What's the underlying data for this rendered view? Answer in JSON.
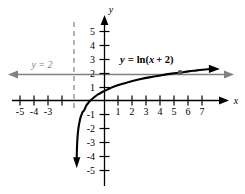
{
  "chart_data": {
    "type": "line",
    "title": "",
    "xlabel": "x",
    "ylabel": "y",
    "xlim": [
      -5.8,
      7.8
    ],
    "ylim": [
      -5.6,
      5.9
    ],
    "grid": false,
    "legend_position": "none",
    "function_label": "y = ln(x + 2)",
    "function_label_parts": {
      "lhs_var": "y",
      "equals": " = ",
      "fn": "ln(",
      "arg_var": "x",
      "arg_rest": " + 2)"
    },
    "asymptote_vertical": {
      "label": "x = -2",
      "x": -2,
      "style": "dashed",
      "color": "#999999"
    },
    "asymptote_horizontal_line": {
      "label": "y = 2",
      "y": 2,
      "style": "solid-arrow-left-right",
      "color": "#808080"
    },
    "marked_point": {
      "x": 5.4,
      "y": 2,
      "style": "filled-dot"
    },
    "x_tick_labels": [
      "-5",
      "-4",
      "-3",
      "1",
      "2",
      "3",
      "4",
      "5",
      "6",
      "7"
    ],
    "x_tick_values": [
      -5,
      -4,
      -3,
      1,
      2,
      3,
      4,
      5,
      6,
      7
    ],
    "y_tick_labels": [
      "5",
      "4",
      "3",
      "2",
      "1",
      "-1",
      "-2",
      "-3",
      "-4",
      "-5"
    ],
    "y_tick_values": [
      5,
      4,
      3,
      2,
      1,
      -1,
      -2,
      -3,
      -4,
      -5
    ],
    "series": [
      {
        "name": "y = ln(x + 2)",
        "color": "#000000",
        "x": [
          -1.985,
          -1.97,
          -1.95,
          -1.92,
          -1.88,
          -1.83,
          -1.78,
          -1.72,
          -1.65,
          -1.55,
          -1.45,
          -1.3,
          -1.15,
          -1.0,
          -0.8,
          -0.6,
          -0.4,
          -0.2,
          0.0,
          0.3,
          0.6,
          1.0,
          1.5,
          2.0,
          2.6,
          3.2,
          4.0,
          4.8,
          5.4,
          6.0,
          6.6,
          7.2,
          7.6
        ],
        "y": [
          -4.2,
          -3.51,
          -3.0,
          -2.53,
          -2.12,
          -1.77,
          -1.51,
          -1.24,
          -1.05,
          -0.8,
          -0.69,
          -0.36,
          -0.16,
          0.0,
          0.18,
          0.34,
          0.47,
          0.59,
          0.69,
          0.83,
          0.96,
          1.1,
          1.25,
          1.39,
          1.53,
          1.65,
          1.79,
          1.92,
          1.99,
          2.08,
          2.15,
          2.22,
          2.26
        ]
      }
    ]
  },
  "labels": {
    "x_axis_name": "x",
    "y_axis_name": "y",
    "asymptote_text": "y = 2",
    "equation_y": "y",
    "equation_eq": "=",
    "equation_ln": "ln(",
    "equation_x": "x",
    "equation_tail": "+ 2)"
  },
  "colors": {
    "curve": "#000000",
    "axis": "#000000",
    "asymptote_horizontal": "#808080",
    "asymptote_vertical": "#999999",
    "background": "#ffffff"
  }
}
